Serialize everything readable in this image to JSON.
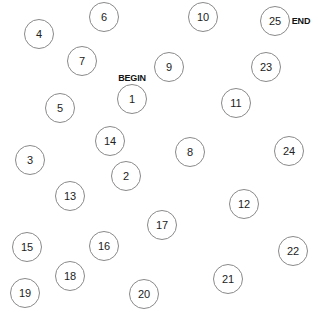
{
  "game": "trail-making-test",
  "labels": {
    "begin": "BEGIN",
    "end": "END"
  },
  "nodes": [
    {
      "label": "1"
    },
    {
      "label": "2"
    },
    {
      "label": "3"
    },
    {
      "label": "4"
    },
    {
      "label": "5"
    },
    {
      "label": "6"
    },
    {
      "label": "7"
    },
    {
      "label": "8"
    },
    {
      "label": "9"
    },
    {
      "label": "10"
    },
    {
      "label": "11"
    },
    {
      "label": "12"
    },
    {
      "label": "13"
    },
    {
      "label": "14"
    },
    {
      "label": "15"
    },
    {
      "label": "16"
    },
    {
      "label": "17"
    },
    {
      "label": "18"
    },
    {
      "label": "19"
    },
    {
      "label": "20"
    },
    {
      "label": "21"
    },
    {
      "label": "22"
    },
    {
      "label": "23"
    },
    {
      "label": "24"
    },
    {
      "label": "25"
    }
  ]
}
